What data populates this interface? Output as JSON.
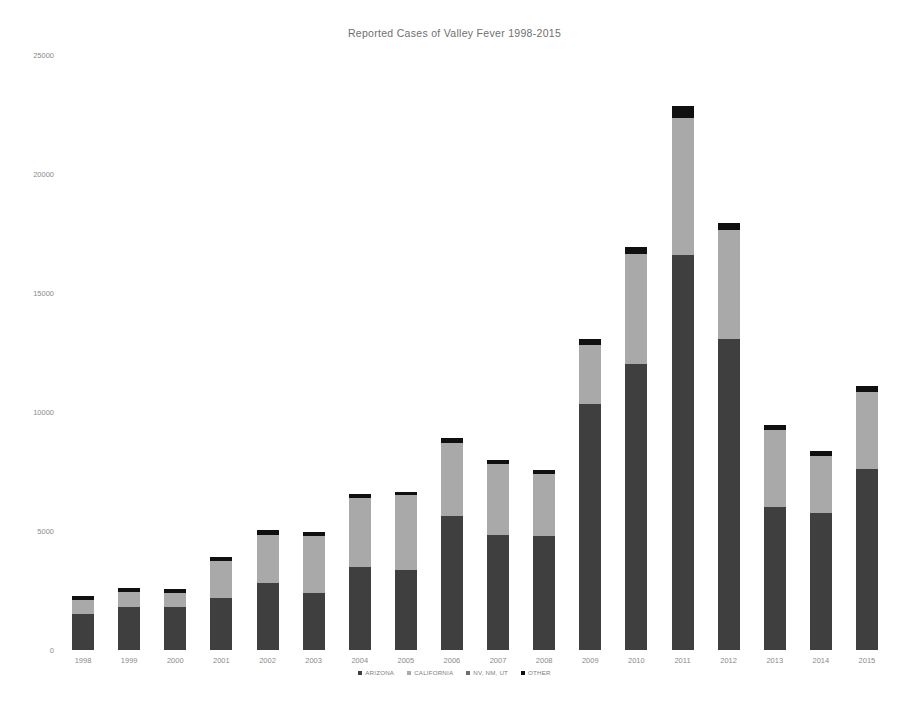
{
  "chart": {
    "title": "Reported Cases of Valley Fever 1998-2015"
  },
  "axes": {
    "y_ticks": [
      "0",
      "5000",
      "10000",
      "15000",
      "20000",
      "25000"
    ],
    "x_ticks": [
      "1998",
      "1999",
      "2000",
      "2001",
      "2002",
      "2003",
      "2004",
      "2005",
      "2006",
      "2007",
      "2008",
      "2009",
      "2010",
      "2011",
      "2012",
      "2013",
      "2014",
      "2015"
    ]
  },
  "legend": {
    "position": "bottom",
    "items": [
      {
        "label": "ARIZONA",
        "color": "#3f3f3f"
      },
      {
        "label": "CALIFORNIA",
        "color": "#a9a9a9"
      },
      {
        "label": "NV, NM, UT",
        "color": "#6e6e6e"
      },
      {
        "label": "OTHER",
        "color": "#101010"
      }
    ]
  },
  "colors": {
    "arizona": "#3f3f3f",
    "california": "#a9a9a9",
    "nv_nm_ut": "#6e6e6e",
    "other": "#101010",
    "axis_text": "#8a8a8a",
    "title_text": "#6f6f6f",
    "background": "#ffffff"
  },
  "chart_data": {
    "type": "bar",
    "subtype": "stacked",
    "title": "Reported Cases of Valley Fever 1998-2015",
    "xlabel": "",
    "ylabel": "",
    "ylim": [
      0,
      25000
    ],
    "grid": false,
    "yticks": [
      0,
      5000,
      10000,
      15000,
      20000,
      25000
    ],
    "categories": [
      "1998",
      "1999",
      "2000",
      "2001",
      "2002",
      "2003",
      "2004",
      "2005",
      "2006",
      "2007",
      "2008",
      "2009",
      "2010",
      "2011",
      "2012",
      "2013",
      "2014",
      "2015"
    ],
    "series": [
      {
        "name": "ARIZONA",
        "color": "#3f3f3f",
        "values": [
          1500,
          1800,
          1800,
          2200,
          2800,
          2400,
          3500,
          3350,
          5650,
          4850,
          4800,
          10350,
          12000,
          16600,
          13050,
          6000,
          5750,
          7600
        ]
      },
      {
        "name": "CALIFORNIA",
        "color": "#a9a9a9",
        "values": [
          600,
          650,
          600,
          1550,
          2050,
          2400,
          2900,
          3150,
          3050,
          2950,
          2600,
          2450,
          4650,
          5750,
          4600,
          3250,
          2400,
          3250
        ]
      },
      {
        "name": "NV, NM, UT",
        "color": "#6e6e6e",
        "values": [
          0,
          0,
          0,
          0,
          0,
          0,
          0,
          0,
          0,
          0,
          0,
          0,
          0,
          0,
          0,
          0,
          0,
          0
        ]
      },
      {
        "name": "OTHER",
        "color": "#101010",
        "values": [
          150,
          150,
          150,
          150,
          200,
          150,
          150,
          150,
          200,
          200,
          150,
          250,
          300,
          500,
          300,
          200,
          200,
          250
        ]
      }
    ],
    "totals": [
      2250,
      2600,
      2550,
      3900,
      5050,
      4950,
      6550,
      6650,
      8900,
      8000,
      7550,
      13050,
      16950,
      22850,
      17950,
      9450,
      8350,
      11100
    ]
  }
}
